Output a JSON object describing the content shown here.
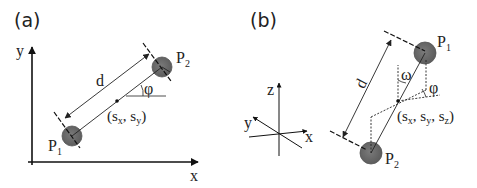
{
  "panels": [
    {
      "id": "a",
      "label": "(a)",
      "axes": {
        "x": "x",
        "y": "y"
      },
      "points": [
        {
          "name": "P",
          "sub": "1"
        },
        {
          "name": "P",
          "sub": "2"
        }
      ],
      "distance_label": "d",
      "angle_label": "φ",
      "center_label": {
        "open": "(s",
        "sx": "x",
        "mid": ", s",
        "sy": "y",
        "close": ")"
      }
    },
    {
      "id": "b",
      "label": "(b)",
      "axes": {
        "x": "x",
        "y": "y",
        "z": "z"
      },
      "points": [
        {
          "name": "P",
          "sub": "1"
        },
        {
          "name": "P",
          "sub": "2"
        }
      ],
      "distance_label": "d",
      "angle_labels": {
        "omega": "ω",
        "phi": "φ"
      },
      "center_label": {
        "open": "(s",
        "sx": "x",
        "mid1": ", s",
        "sy": "y",
        "mid2": ", s",
        "sz": "z",
        "close": ")"
      }
    }
  ],
  "colors": {
    "line": "#222222",
    "sphere": "#6e6e6e",
    "sphere_edge": "#4a4a4a"
  }
}
